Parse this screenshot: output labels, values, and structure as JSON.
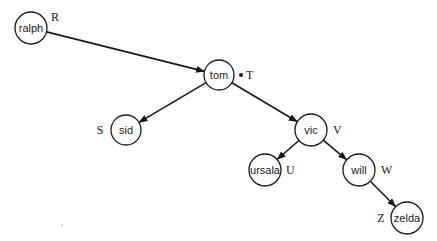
{
  "diagram": {
    "type": "tree",
    "nodes": [
      {
        "id": "ralph",
        "label": "ralph",
        "tag": "R",
        "x": 31,
        "y": 28,
        "r": 16,
        "tag_x": 51,
        "tag_y": 17,
        "tag_side": "right"
      },
      {
        "id": "tom",
        "label": "tom",
        "tag": "T",
        "x": 219,
        "y": 75,
        "r": 15,
        "tag_x": 246,
        "tag_y": 75,
        "tag_side": "right",
        "marker_dot": true,
        "dot_x": 241,
        "dot_y": 75
      },
      {
        "id": "sid",
        "label": "sid",
        "tag": "S",
        "x": 126,
        "y": 130,
        "r": 15,
        "tag_x": 100,
        "tag_y": 130,
        "tag_side": "left"
      },
      {
        "id": "vic",
        "label": "vic",
        "tag": "V",
        "x": 311,
        "y": 130,
        "r": 16,
        "tag_x": 333,
        "tag_y": 130,
        "tag_side": "right"
      },
      {
        "id": "ursala",
        "label": "ursala",
        "tag": "U",
        "x": 265,
        "y": 170,
        "r": 16,
        "tag_x": 286,
        "tag_y": 170,
        "tag_side": "right"
      },
      {
        "id": "will",
        "label": "will",
        "tag": "W",
        "x": 359,
        "y": 170,
        "r": 16,
        "tag_x": 381,
        "tag_y": 170,
        "tag_side": "right"
      },
      {
        "id": "zelda",
        "label": "zelda",
        "tag": "Z",
        "x": 407,
        "y": 218,
        "r": 16,
        "tag_x": 381,
        "tag_y": 218,
        "tag_side": "left"
      }
    ],
    "edges": [
      {
        "from": "ralph",
        "to": "tom"
      },
      {
        "from": "tom",
        "to": "sid"
      },
      {
        "from": "tom",
        "to": "vic"
      },
      {
        "from": "vic",
        "to": "ursala"
      },
      {
        "from": "vic",
        "to": "will"
      },
      {
        "from": "will",
        "to": "zelda"
      }
    ],
    "colors": {
      "stroke": "#1a1a1a",
      "background": "#ffffff"
    }
  }
}
